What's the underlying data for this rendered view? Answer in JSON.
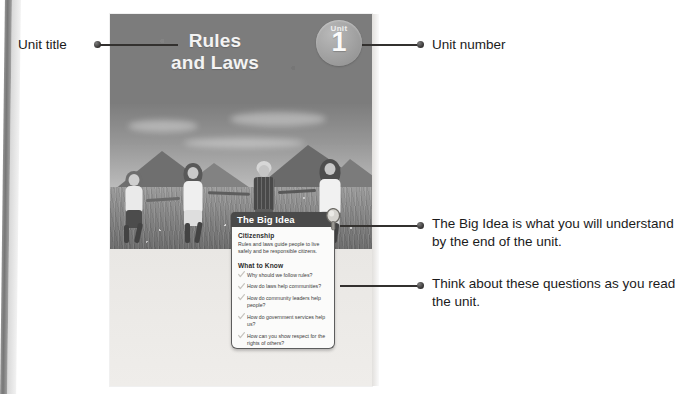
{
  "annotations": {
    "unit_title": "Unit title",
    "unit_number": "Unit number",
    "big_idea_note": "The Big Idea is what you will understand by the end of the unit.",
    "questions_note": "Think about these questions as you read the unit."
  },
  "textbook_page": {
    "unit_title": "Rules\nand Laws",
    "unit_title_line1": "Rules",
    "unit_title_line2": "and Laws",
    "badge": {
      "label": "Unit",
      "number": "1"
    },
    "photo_alt": "Four children holding hands running through a meadow with mountains behind",
    "big_idea": {
      "header": "The Big Idea",
      "concept_heading": "Citizenship",
      "concept_text": "Rules and laws guide people to live safely and be responsible citizens.",
      "what_to_know_heading": "What to Know",
      "questions": [
        "Why should we follow rules?",
        "How do laws help communities?",
        "How do community leaders help people?",
        "How do government services help us?",
        "How can you show respect for the rights of others?"
      ]
    }
  },
  "colors": {
    "header_band": "#7c7c7c",
    "big_idea_bar": "#4a4a4a",
    "page_body": "#eceae7",
    "annotation_text": "#1b1b1b",
    "leader_line": "#33312f"
  }
}
